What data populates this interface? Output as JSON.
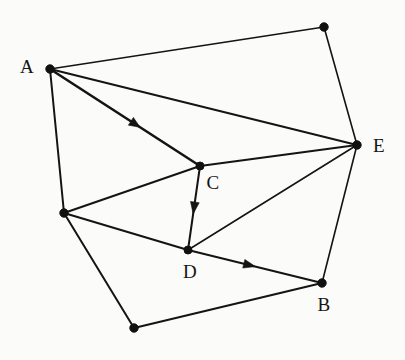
{
  "figure": {
    "kind": "undirected-graph-with-directed-edges",
    "background_color": "#fbfbfa",
    "ink_color": "#141414",
    "width": 405,
    "height": 360
  },
  "nodes": [
    {
      "id": "A",
      "label": "A",
      "x": 50,
      "y": 69,
      "r": 4.2,
      "label_x": 27,
      "label_y": 66,
      "labeled": true
    },
    {
      "id": "G",
      "label": "",
      "x": 324,
      "y": 27,
      "r": 4.2,
      "label_x": 0,
      "label_y": 0,
      "labeled": false
    },
    {
      "id": "E",
      "label": "E",
      "x": 357,
      "y": 145,
      "r": 4.2,
      "label_x": 379,
      "label_y": 145,
      "labeled": true
    },
    {
      "id": "C",
      "label": "C",
      "x": 200,
      "y": 166,
      "r": 4.0,
      "label_x": 213,
      "label_y": 182,
      "labeled": true
    },
    {
      "id": "F",
      "label": "",
      "x": 64,
      "y": 213,
      "r": 4.2,
      "label_x": 0,
      "label_y": 0,
      "labeled": false
    },
    {
      "id": "D",
      "label": "D",
      "x": 188,
      "y": 250,
      "r": 4.0,
      "label_x": 190,
      "label_y": 271,
      "labeled": true
    },
    {
      "id": "B",
      "label": "B",
      "x": 322,
      "y": 283,
      "r": 4.2,
      "label_x": 324,
      "label_y": 304,
      "labeled": true
    },
    {
      "id": "H",
      "label": "",
      "x": 134,
      "y": 328,
      "r": 4.2,
      "label_x": 0,
      "label_y": 0,
      "labeled": false
    }
  ],
  "edges": [
    {
      "id": "A-G",
      "from": "A",
      "to": "G",
      "directed": false,
      "weight": "thin"
    },
    {
      "id": "G-E",
      "from": "G",
      "to": "E",
      "directed": false,
      "weight": "thin"
    },
    {
      "id": "A-E",
      "from": "A",
      "to": "E",
      "directed": false,
      "weight": "med"
    },
    {
      "id": "A-C",
      "from": "A",
      "to": "C",
      "directed": true,
      "weight": "bold",
      "arrow_t": 0.57
    },
    {
      "id": "A-F",
      "from": "A",
      "to": "F",
      "directed": false,
      "weight": "med"
    },
    {
      "id": "F-C",
      "from": "F",
      "to": "C",
      "directed": false,
      "weight": "med"
    },
    {
      "id": "F-D",
      "from": "F",
      "to": "D",
      "directed": false,
      "weight": "med"
    },
    {
      "id": "F-H",
      "from": "F",
      "to": "H",
      "directed": false,
      "weight": "med"
    },
    {
      "id": "C-D",
      "from": "C",
      "to": "D",
      "directed": true,
      "weight": "med",
      "arrow_t": 0.5
    },
    {
      "id": "C-E",
      "from": "C",
      "to": "E",
      "directed": false,
      "weight": "med"
    },
    {
      "id": "D-E",
      "from": "D",
      "to": "E",
      "directed": false,
      "weight": "thin"
    },
    {
      "id": "D-B",
      "from": "D",
      "to": "B",
      "directed": true,
      "weight": "med",
      "arrow_t": 0.46
    },
    {
      "id": "E-B",
      "from": "E",
      "to": "B",
      "directed": false,
      "weight": "thin"
    },
    {
      "id": "B-H",
      "from": "B",
      "to": "H",
      "directed": false,
      "weight": "med"
    }
  ],
  "labels": {
    "A": "A",
    "B": "B",
    "C": "C",
    "D": "D",
    "E": "E"
  }
}
